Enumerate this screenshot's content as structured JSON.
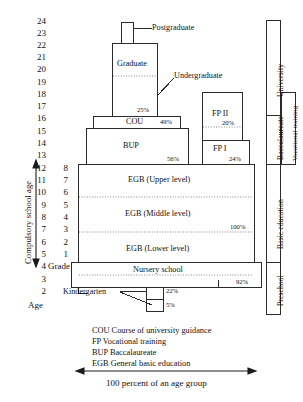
{
  "axes": {
    "age_caption": "Age",
    "grade_caption": "Grade",
    "compulsory_label": "Compulsory school age",
    "age_ticks": [
      24,
      23,
      22,
      21,
      20,
      19,
      18,
      17,
      16,
      15,
      14,
      13,
      12,
      11,
      10,
      9,
      8,
      7,
      6,
      5,
      4,
      3,
      2
    ],
    "grade_ticks": [
      8,
      7,
      6,
      5,
      4,
      3,
      2,
      1
    ]
  },
  "blocks": {
    "postgraduate": {
      "label": "Postgraduate"
    },
    "graduate": {
      "label": "Graduate"
    },
    "undergraduate": {
      "label": "Undergraduate",
      "percent": "25%"
    },
    "cou": {
      "label": "COU",
      "percent": "49%"
    },
    "bup": {
      "label": "BUP",
      "percent": "56%"
    },
    "fp2": {
      "label": "FP II",
      "percent": "20%"
    },
    "fp1": {
      "label": "FP I",
      "percent": "24%"
    },
    "egb_upper": {
      "label": "EGB (Upper level)"
    },
    "egb_middle": {
      "label": "EGB (Middle level)",
      "percent": "100%"
    },
    "egb_lower": {
      "label": "EGB (Lower level)"
    },
    "nursery": {
      "label": "Nursery school",
      "percent": "92%"
    },
    "kindergarten": {
      "label": "Kindergarten",
      "percent_upper": "22%",
      "percent_lower": "5%"
    }
  },
  "side_categories": [
    {
      "label": "University"
    },
    {
      "label": "Baccalaureate"
    },
    {
      "label": "Vocational training"
    },
    {
      "label": "Basic education"
    },
    {
      "label": "Preschool"
    }
  ],
  "legend": [
    "COU Course of university guidance",
    "FP Vocational training",
    "BUP Baccalaureate",
    "EGB General basic education"
  ],
  "footer": {
    "caption": "100 percent of an age group"
  },
  "colors": {
    "line": "#2b2b2b",
    "dotted": "#8a8a8a",
    "text": "#111111"
  }
}
